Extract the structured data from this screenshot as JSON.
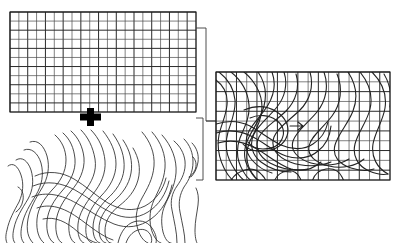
{
  "figure": {
    "background_color": "#ffffff",
    "width": 402,
    "height": 243,
    "line_color": "#2b2b2b",
    "grid_color": "#4a4a4a",
    "marker_color": "#000000"
  },
  "panels": [
    {
      "id": "regular-grid",
      "name": "Regular rectangular mesh",
      "role": "undeformed reference grid",
      "x": 10,
      "y": 12,
      "width": 186,
      "height": 100,
      "columns": 21,
      "rows": 11,
      "cell_width": 8.857,
      "cell_height": 9.091,
      "major_every_columns": 2,
      "major_every_rows": 2,
      "stroke": "#4a4a4a"
    },
    {
      "id": "contour-map",
      "name": "Contour field map",
      "role": "scalar field isolines",
      "x": 4,
      "y": 126,
      "width": 198,
      "height": 117,
      "contour_count": 26,
      "stroke": "#2b2b2b"
    },
    {
      "id": "warped-grid",
      "name": "Deformed mesh with isolines",
      "role": "grid overlaid with warped contour streamlines",
      "x": 216,
      "y": 72,
      "width": 174,
      "height": 108,
      "columns": 17,
      "rows": 11,
      "cell_width": 10.235,
      "cell_height": 9.818,
      "warp_curve_count": 22,
      "stroke": "#222222"
    }
  ],
  "markers": [
    {
      "id": "cross-marker",
      "name": "plus-marker",
      "shape": "cross",
      "x": 80,
      "y": 108,
      "width": 21,
      "height": 18,
      "arm_thickness": 7,
      "color": "#000000"
    }
  ],
  "connectors": [
    {
      "id": "grid-to-warped",
      "name": "bracket from regular grid to warped grid",
      "from_panel": "regular-grid",
      "to_panel": "warped-grid",
      "path": "M 196 28 L 206 28 L 206 121 L 216 121",
      "stroke": "#3a3a3a"
    },
    {
      "id": "contour-to-warped",
      "name": "bracket from contour map to warped grid",
      "from_panel": "contour-map",
      "to_panel": "warped-grid",
      "path": "M 196 118 L 203 118 L 203 180 L 196 180",
      "stroke": "#3a3a3a"
    },
    {
      "id": "warped-inlet",
      "name": "short inlet tick on warped grid left edge",
      "from_panel": "warped-grid",
      "to_panel": "warped-grid",
      "path": "M 206 121 L 216 121",
      "stroke": "#3a3a3a"
    }
  ],
  "chart_data": {
    "type": "line",
    "xlabel": "",
    "ylabel": "",
    "grid": true,
    "legend": "none",
    "series": [
      {
        "name": "regular-mesh-columns",
        "count": 22,
        "spacing": 8.857,
        "orientation": "vertical"
      },
      {
        "name": "regular-mesh-rows",
        "count": 12,
        "spacing": 9.091,
        "orientation": "horizontal"
      },
      {
        "name": "contour-isolines",
        "count": 26,
        "description": "nested sinuous isolines forming a saddle and two ridges"
      },
      {
        "name": "warped-mesh-columns",
        "count": 18,
        "spacing": 10.235,
        "orientation": "vertical"
      },
      {
        "name": "warped-mesh-rows",
        "count": 12,
        "spacing": 9.818,
        "orientation": "horizontal"
      },
      {
        "name": "warped-streamlines",
        "count": 22,
        "description": "S-shaped deformation curves crossing the mesh"
      }
    ]
  }
}
